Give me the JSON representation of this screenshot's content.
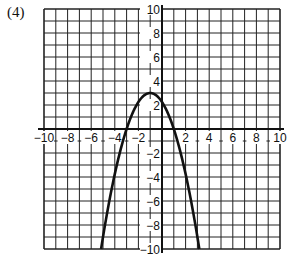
{
  "problem_label": "(4)",
  "chart_data": {
    "type": "line",
    "title": "",
    "xlabel": "",
    "ylabel": "",
    "xlim": [
      -10,
      10
    ],
    "ylim": [
      -10,
      10
    ],
    "grid": true,
    "grid_step": 1,
    "x_tick_labels": [
      "-10",
      "-8",
      "-6",
      "-4",
      "-2",
      "2",
      "4",
      "6",
      "8",
      "10"
    ],
    "y_tick_labels": [
      "10",
      "8",
      "6",
      "4",
      "2",
      "-2",
      "-4",
      "-6",
      "-8",
      "-10"
    ],
    "series": [
      {
        "name": "parabola",
        "equation": "y = -0.75(x + 1)^2 + 3",
        "vertex": [
          -1,
          3
        ],
        "x_intercepts": [
          -3,
          1
        ],
        "y_intercept": 2.25,
        "points": [
          [
            -5.2,
            -10
          ],
          [
            -5,
            -9
          ],
          [
            -4,
            -3.75
          ],
          [
            -3,
            0
          ],
          [
            -2,
            2.25
          ],
          [
            -1,
            3
          ],
          [
            0,
            2.25
          ],
          [
            1,
            0
          ],
          [
            2,
            -3.75
          ],
          [
            3,
            -9
          ],
          [
            3.2,
            -10
          ]
        ]
      }
    ]
  }
}
